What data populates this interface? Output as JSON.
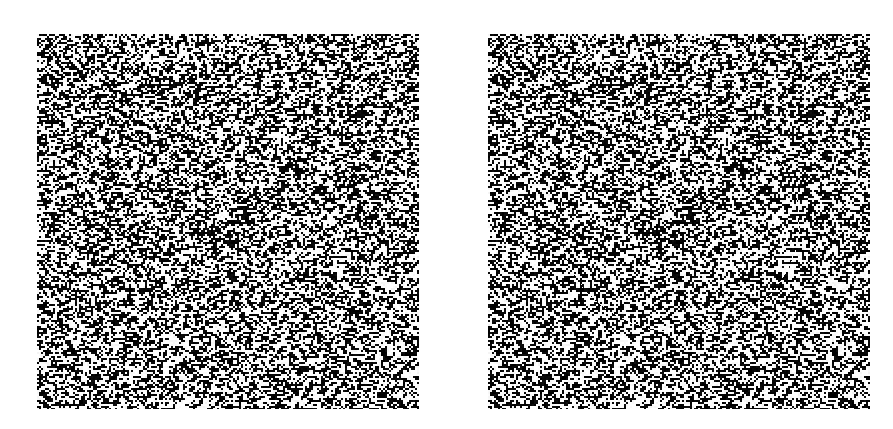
{
  "figure": {
    "background_color": "#ffffff",
    "panels": [
      {
        "id": "left",
        "kind": "random-dot-noise",
        "x": 37,
        "y": 34,
        "width": 382,
        "height": 375,
        "dark_color": "#111111",
        "light_color": "#f4f4f4",
        "seed": 17
      },
      {
        "id": "right",
        "kind": "random-dot-noise",
        "x": 488,
        "y": 34,
        "width": 382,
        "height": 375,
        "dark_color": "#111111",
        "light_color": "#f4f4f4",
        "seed": 17
      }
    ]
  }
}
